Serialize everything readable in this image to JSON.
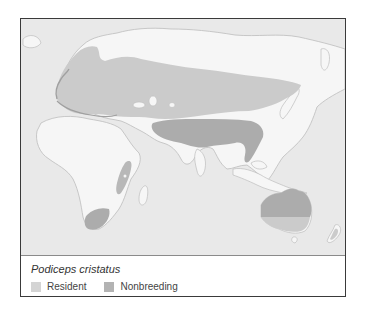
{
  "map": {
    "species": "Podiceps cristatus",
    "colors": {
      "ocean": "#e9e9e9",
      "land": "#f6f6f6",
      "coastline": "#bdbdbd",
      "resident": "#cbcbcb",
      "nonbreeding": "#acacac"
    },
    "ranges": [
      {
        "label": "Resident",
        "regions": [
          "Europe",
          "Western and Central Asia",
          "Southern Africa",
          "Southern Australia",
          "New Zealand",
          "East Africa lakes"
        ]
      },
      {
        "label": "Nonbreeding",
        "regions": [
          "South Asia",
          "Central Asia south of 40N",
          "Eastern Australia",
          "South Africa"
        ]
      }
    ]
  },
  "legend": {
    "items": [
      {
        "label": "Resident",
        "color": "#d4d4d4"
      },
      {
        "label": "Nonbreeding",
        "color": "#b3b3b3"
      }
    ]
  }
}
